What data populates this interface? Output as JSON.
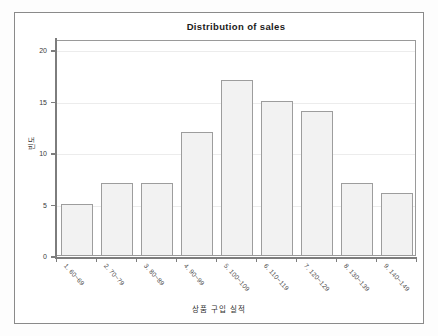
{
  "chart_data": {
    "type": "bar",
    "title": "Distribution of sales",
    "xlabel": "상품 구입 실적",
    "ylabel": "빈도",
    "categories": [
      "1. 60~69",
      "2. 70~79",
      "3. 80~89",
      "4. 90~99",
      "5. 100~109",
      "6. 110~119",
      "7. 120~129",
      "8. 130~139",
      "9. 140~149"
    ],
    "values": [
      5,
      7,
      7,
      12,
      17,
      15,
      14,
      7,
      6
    ],
    "ylim": [
      0,
      21
    ],
    "yticks": [
      0,
      5,
      10,
      15,
      20
    ],
    "ytick_labels": [
      "0",
      "5",
      "10",
      "15",
      "20"
    ],
    "grid": true,
    "legend": "none",
    "bar_color": "#f2f2f2",
    "bar_border_color": "#9d9d9d",
    "axis_color": "#7d7d7d",
    "grid_color": "#ececec",
    "frame_color": "#8a8a8a",
    "background": "#ffffff"
  }
}
